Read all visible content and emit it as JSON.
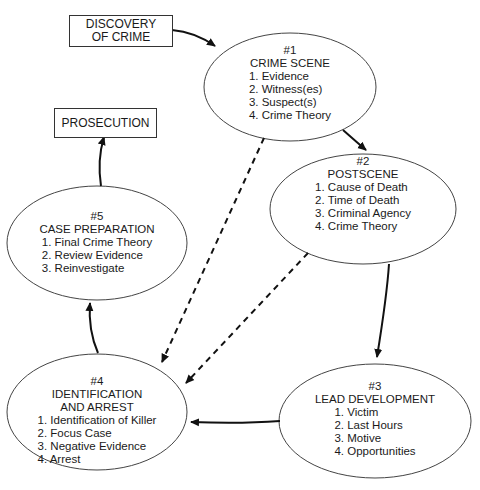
{
  "boxes": {
    "discovery": {
      "line1": "DISCOVERY",
      "line2": "OF CRIME"
    },
    "prosecution": {
      "label": "PROSECUTION"
    }
  },
  "nodes": {
    "n1": {
      "num": "#1",
      "title": "CRIME SCENE",
      "items": [
        "1. Evidence",
        "2. Witness(es)",
        "3. Suspect(s)",
        "4. Crime Theory"
      ]
    },
    "n2": {
      "num": "#2",
      "title": "POSTSCENE",
      "items": [
        "1. Cause of Death",
        "2. Time of Death",
        "3. Criminal Agency",
        "4. Crime Theory"
      ]
    },
    "n3": {
      "num": "#3",
      "title": "LEAD DEVELOPMENT",
      "items": [
        "1. Victim",
        "2. Last Hours",
        "3. Motive",
        "4. Opportunities"
      ]
    },
    "n4": {
      "num": "#4",
      "title1": "IDENTIFICATION",
      "title2": "AND ARREST",
      "items": [
        "1. Identification of Killer",
        "2. Focus Case",
        "3. Negative Evidence",
        "4. Arrest"
      ]
    },
    "n5": {
      "num": "#5",
      "title": "CASE PREPARATION",
      "items": [
        "1. Final Crime Theory",
        "2. Review Evidence",
        "3. Reinvestigate"
      ]
    }
  },
  "edges": [
    {
      "from": "DISCOVERY OF CRIME",
      "to": "#1",
      "style": "solid"
    },
    {
      "from": "#1",
      "to": "#2",
      "style": "solid"
    },
    {
      "from": "#2",
      "to": "#3",
      "style": "solid"
    },
    {
      "from": "#3",
      "to": "#4",
      "style": "solid"
    },
    {
      "from": "#4",
      "to": "#5",
      "style": "solid"
    },
    {
      "from": "#5",
      "to": "PROSECUTION",
      "style": "solid"
    },
    {
      "from": "#1",
      "to": "#4",
      "style": "dashed"
    },
    {
      "from": "#2",
      "to": "#4",
      "style": "dashed"
    }
  ]
}
